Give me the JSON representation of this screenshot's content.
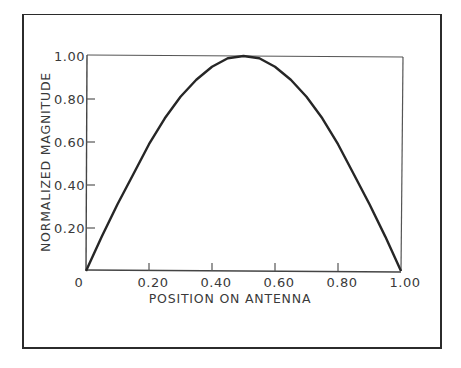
{
  "chart_data": {
    "type": "line",
    "title": "",
    "xlabel": "POSITION ON ANTENNA",
    "ylabel": "NORMALIZED MAGNITUDE",
    "xlim": [
      0,
      1.0
    ],
    "ylim": [
      0,
      1.0
    ],
    "grid": false,
    "legend": null,
    "x_ticks": [
      "0",
      "0.20",
      "0.40",
      "0.60",
      "0.80",
      "1.00"
    ],
    "y_ticks": [
      "0.20",
      "0.40",
      "0.60",
      "0.80",
      "1.00"
    ],
    "series": [
      {
        "name": "current distribution",
        "x": [
          0,
          0.05,
          0.1,
          0.15,
          0.2,
          0.25,
          0.3,
          0.35,
          0.4,
          0.45,
          0.5,
          0.55,
          0.6,
          0.65,
          0.7,
          0.75,
          0.8,
          0.85,
          0.9,
          0.95,
          1.0
        ],
        "values": [
          0,
          0.16,
          0.31,
          0.45,
          0.59,
          0.71,
          0.81,
          0.89,
          0.95,
          0.99,
          1.0,
          0.99,
          0.95,
          0.89,
          0.81,
          0.71,
          0.59,
          0.45,
          0.31,
          0.16,
          0
        ]
      }
    ]
  },
  "labels": {
    "x_title": "POSITION ON ANTENNA",
    "y_title": "NORMALIZED MAGNITUDE"
  }
}
